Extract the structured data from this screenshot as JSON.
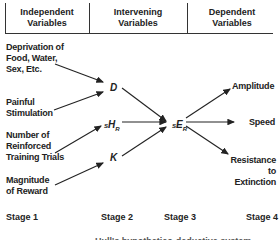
{
  "header": {
    "columns": [
      {
        "label": "Independent Variables"
      },
      {
        "label": "Intervening Variables"
      },
      {
        "label": "Dependent Variables"
      }
    ]
  },
  "independent": [
    {
      "label": "Deprivation of Food, Water, Sex, Etc."
    },
    {
      "label": "Painful Stimulation"
    },
    {
      "label": "Number of Reinforced Training Trials"
    },
    {
      "label": "Magnitude of Reward"
    }
  ],
  "intervening": {
    "d": "D",
    "habit": {
      "pre": "S",
      "main": "H",
      "sub": "R"
    },
    "k": "K"
  },
  "reaction_potential": {
    "pre": "S",
    "main": "E",
    "sub": "R"
  },
  "dependent": [
    {
      "label": "Amplitude"
    },
    {
      "label": "Speed"
    },
    {
      "label": "Resistance to Extinction"
    }
  ],
  "stages": [
    "Stage 1",
    "Stage 2",
    "Stage 3",
    "Stage 4"
  ],
  "caption": "Hull's hypothetico-deductive system"
}
